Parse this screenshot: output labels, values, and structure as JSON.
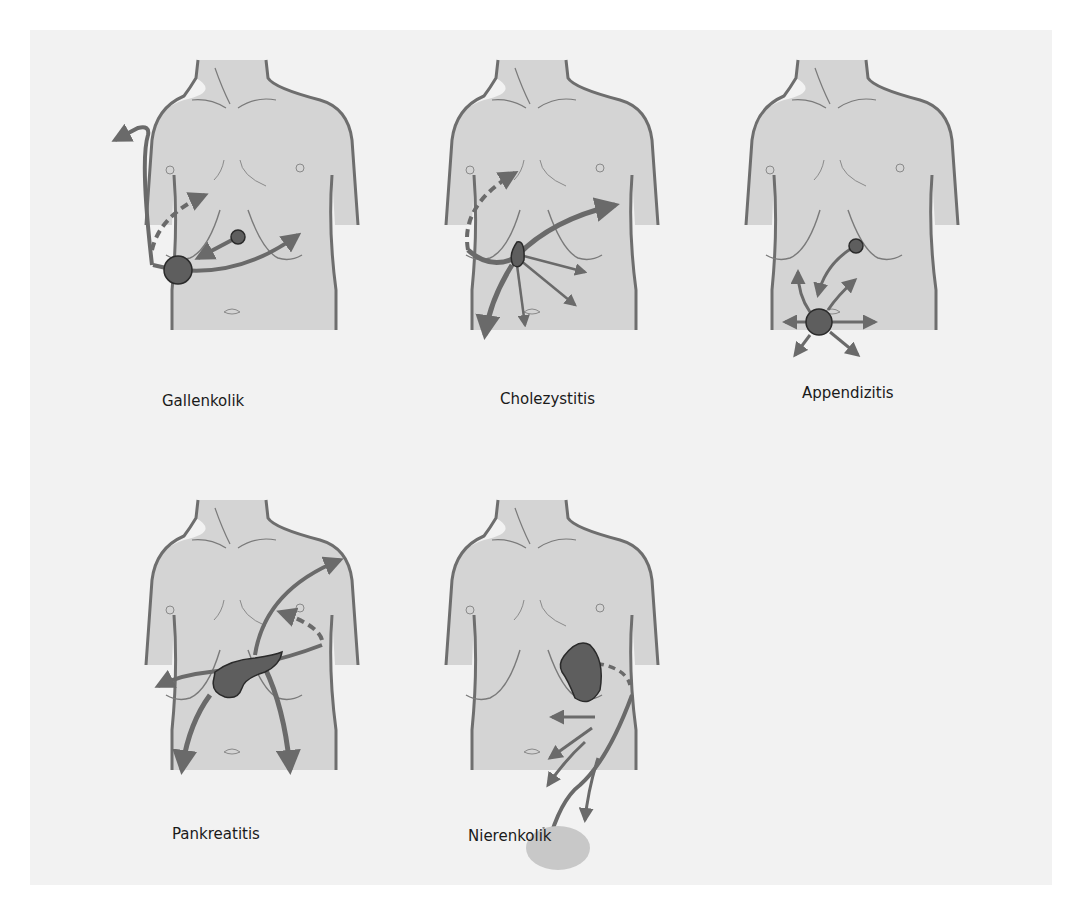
{
  "diagram": {
    "figures": [
      {
        "id": "gallenkolik",
        "label": "Gallenkolik"
      },
      {
        "id": "cholezystitis",
        "label": "Cholezystitis"
      },
      {
        "id": "appendizitis",
        "label": "Appendizitis"
      },
      {
        "id": "pankreatitis",
        "label": "Pankreatitis"
      },
      {
        "id": "nierenkolik",
        "label": "Nierenkolik"
      }
    ],
    "colors": {
      "background": "#f2f2f2",
      "skin": "#d4d4d4",
      "outline": "#6e6e6e",
      "arrow": "#6a6a6a",
      "organ": "#5e5e5e",
      "organ_outline": "#2a2a2a",
      "label_text": "#1a1a1a"
    }
  }
}
